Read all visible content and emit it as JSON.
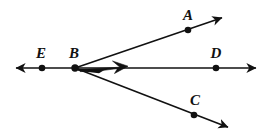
{
  "figure": {
    "type": "geometry-diagram",
    "background_color": "#ffffff",
    "stroke_color": "#111111",
    "width": 271,
    "height": 137
  },
  "points": [
    {
      "id": "E",
      "label": "E",
      "x": 42,
      "y": 68,
      "label_x": 41,
      "label_y": 58,
      "dot_radius": 3.2
    },
    {
      "id": "B",
      "label": "B",
      "x": 75,
      "y": 68,
      "label_x": 74,
      "label_y": 58,
      "dot_radius": 3.6
    },
    {
      "id": "D",
      "label": "D",
      "x": 216,
      "y": 68,
      "label_x": 216,
      "label_y": 58,
      "dot_radius": 3.2
    },
    {
      "id": "A",
      "label": "A",
      "x": 188,
      "y": 30,
      "label_x": 188,
      "label_y": 20,
      "dot_radius": 3.2
    },
    {
      "id": "C",
      "label": "C",
      "x": 194,
      "y": 115,
      "label_x": 195,
      "label_y": 105,
      "dot_radius": 3.2
    }
  ],
  "lines": [
    {
      "id": "line-ED",
      "name": "horizontal-line-EBD",
      "x1": 16,
      "y1": 68,
      "x2": 256,
      "y2": 68,
      "arrow_start": true,
      "arrow_end": true
    },
    {
      "id": "ray-BA",
      "name": "ray-B-to-A",
      "x1": 75,
      "y1": 68,
      "x2": 224,
      "y2": 17,
      "arrow_start": false,
      "arrow_end": true
    },
    {
      "id": "ray-BC",
      "name": "ray-B-to-C",
      "x1": 75,
      "y1": 68,
      "x2": 230,
      "y2": 128,
      "arrow_start": false,
      "arrow_end": true
    }
  ],
  "angle_marker": {
    "id": "angle-ABD",
    "name": "shaded-angle-marker-ABD",
    "vertex": "B",
    "between": [
      "D",
      "A"
    ],
    "fill": "#111111",
    "path": "M 79 68 L 118 68 L 111 62 L 126 66 L 113 73 L 116 69 L 79 70 Z"
  },
  "stroke_width": 1.6
}
